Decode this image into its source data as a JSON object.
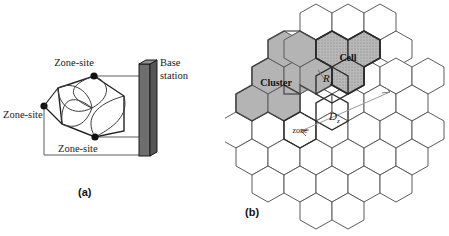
{
  "figure": {
    "panel_a": {
      "caption": "(a)",
      "labels": {
        "zone_site_top": "Zone-site",
        "zone_site_left": "Zone-site",
        "zone_site_bottom": "Zone-site",
        "base_station_line1": "Base",
        "base_station_line2": "station"
      },
      "colors": {
        "base_station_face": "#6e6e6e",
        "base_station_side": "#555555",
        "base_station_top": "#8f8f8f",
        "outline": "#1a1a1a",
        "node": "#111111"
      },
      "node_count": 3
    },
    "panel_b": {
      "caption": "(b)",
      "labels": {
        "cluster": "Cluster",
        "cell": "Cell",
        "zone": "zone",
        "radius": "R",
        "radius_sub": "z",
        "distance": "D",
        "distance_sub": "z"
      },
      "colors": {
        "cluster_fill": "#b0b0b0",
        "cell_fill": "#a8a8a8",
        "hex_stroke": "#4a4a4a",
        "hex_stroke_dark": "#2b2b2b",
        "hex_fill": "#ffffff",
        "arrow": "#8a8a8a"
      },
      "cluster_hex_count": 7,
      "cell_hex_count": 3
    }
  }
}
